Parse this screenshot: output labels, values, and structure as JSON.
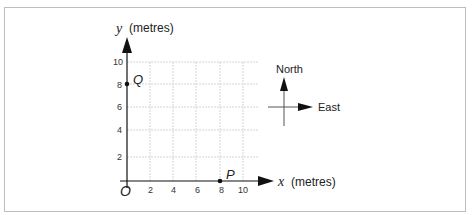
{
  "diagram": {
    "y_axis": {
      "symbol": "y",
      "unit": "(metres)",
      "ticks": [
        "2",
        "4",
        "6",
        "8",
        "10"
      ]
    },
    "x_axis": {
      "symbol": "x",
      "unit": "(metres)",
      "ticks": [
        "2",
        "4",
        "6",
        "8",
        "10"
      ]
    },
    "origin": "O",
    "points": [
      {
        "label": "Q",
        "x": 0,
        "y": 8
      },
      {
        "label": "P",
        "x": 8,
        "y": 0
      }
    ],
    "compass": {
      "north": "North",
      "east": "East"
    },
    "colors": {
      "axis": "#111111",
      "grid": "#d0d0d0",
      "frame": "#bdbdbd"
    }
  }
}
